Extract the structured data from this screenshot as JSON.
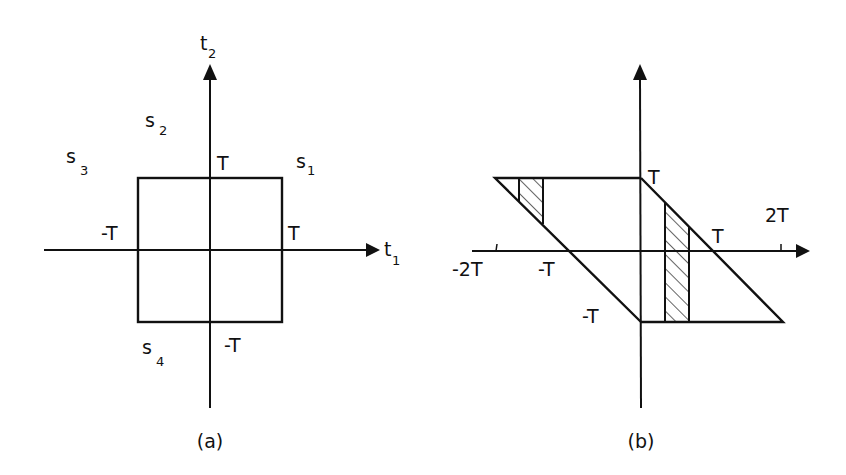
{
  "figure": {
    "panels": [
      {
        "id": "a",
        "caption": "(a)",
        "axes": {
          "x_label": "t",
          "x_label_sub": "1",
          "y_label": "t",
          "y_label_sub": "2"
        },
        "tick_labels": {
          "x_pos": "T",
          "x_neg": "-T",
          "y_pos": "T",
          "y_neg": "-T"
        },
        "region_labels": [
          {
            "name": "s",
            "sub": "1"
          },
          {
            "name": "s",
            "sub": "2"
          },
          {
            "name": "s",
            "sub": "3"
          },
          {
            "name": "s",
            "sub": "4"
          }
        ],
        "shape": "square from (-T,-T) to (T,T)"
      },
      {
        "id": "b",
        "caption": "(b)",
        "tick_labels": {
          "x_neg2": "-2T",
          "x_neg1": "-T",
          "x_pos1": "T",
          "x_pos2": "2T",
          "y_pos": "T",
          "y_neg": "-T"
        },
        "shapes": [
          "left triangle with vertices (-2T,T), (0,T), (0,-T)",
          "right triangle with vertices (0,T), (0,-T), (2T,-T)"
        ],
        "hatched_strips": 2
      }
    ]
  },
  "colors": {
    "ink": "#111111",
    "background": "#ffffff"
  }
}
